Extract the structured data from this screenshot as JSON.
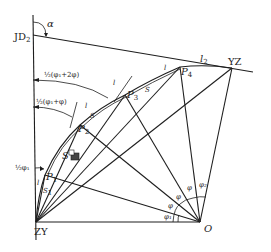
{
  "diagram": {
    "title": "",
    "labels": {
      "jd": "JD",
      "jd_sub": "2",
      "alpha": "α",
      "zy": "ZY",
      "yz": "YZ",
      "o": "O",
      "p1": "P",
      "p1_sub": "1",
      "p2": "P",
      "p2_sub": "2",
      "p3": "P",
      "p3_sub": "3",
      "p4": "P",
      "p4_sub": "4",
      "l2": "l",
      "l2_sub": "2",
      "l_a": "l",
      "l_b": "l",
      "l_c": "l",
      "l_d": "l",
      "s_a": "S",
      "s_b": "S",
      "s_c": "S",
      "s1": "S",
      "s1_sub": "1",
      "half_phi1_plus_2phi": "½(φ₁+2φ)",
      "half_phi1_plus_phi": "½(φ₁+φ)",
      "half_phi1": "½φ₁",
      "phi1": "φ₁",
      "phi_a": "φ",
      "phi_b": "φ",
      "phi_c": "φ",
      "phi2": "φ₂"
    }
  }
}
